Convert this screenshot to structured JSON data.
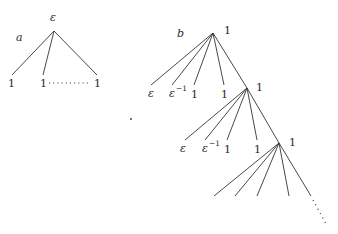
{
  "diagram": {
    "tree_a": {
      "panel_label": "a",
      "root_label": "ε",
      "leaves": [
        "1",
        "1",
        "1"
      ],
      "ellipsis": "horizontal dots between 2nd and last leaf"
    },
    "tree_b": {
      "panel_label": "b",
      "levels": [
        {
          "node_label": "1",
          "leaves": [
            "ε",
            "ε",
            "1",
            "1"
          ],
          "leaf_superscripts": [
            "",
            "−1",
            "",
            ""
          ]
        },
        {
          "node_label": "1",
          "leaves": [
            "ε",
            "ε",
            "1",
            "1"
          ],
          "leaf_superscripts": [
            "",
            "−1",
            "",
            ""
          ]
        },
        {
          "node_label": "1",
          "leaves": [
            "",
            "",
            "",
            ""
          ],
          "continues": true
        }
      ]
    },
    "colors": {
      "ink": "#333333",
      "background": "#ffffff"
    }
  }
}
